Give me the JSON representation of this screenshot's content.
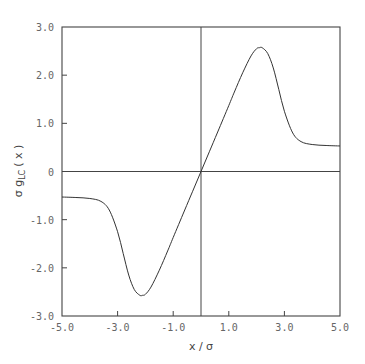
{
  "chart_data": {
    "type": "line",
    "title": "",
    "xlabel": "x / σ",
    "ylabel": "σ g_LC (x)",
    "ylabel_parts": {
      "main": "σ g",
      "sub": "LC",
      "tail": " ( x )"
    },
    "xlim": [
      -5.0,
      5.0
    ],
    "ylim": [
      -3.0,
      3.0
    ],
    "xticks": [
      -5.0,
      -3.0,
      -1.0,
      1.0,
      3.0,
      5.0
    ],
    "xtick_labels": [
      "-5.0",
      "-3.0",
      "-1.0",
      "1.0",
      "3.0",
      "5.0"
    ],
    "yticks": [
      3.0,
      2.0,
      1.0,
      0,
      -1.0,
      -2.0,
      -3.0
    ],
    "ytick_labels": [
      "3.0",
      "2.0",
      "1.0",
      "0",
      "-1.0",
      "-2.0",
      "-3.0"
    ],
    "grid": false,
    "zero_lines": true,
    "legend": null,
    "series": [
      {
        "name": "g_LC",
        "x": [
          -5.0,
          -4.5,
          -4.0,
          -3.6,
          -3.3,
          -3.0,
          -2.8,
          -2.6,
          -2.4,
          -2.2,
          -2.1,
          -2.0,
          -1.8,
          -1.5,
          -1.2,
          -1.0,
          -0.6,
          -0.3,
          0.0,
          0.3,
          0.6,
          1.0,
          1.2,
          1.5,
          1.8,
          2.0,
          2.1,
          2.2,
          2.4,
          2.6,
          2.8,
          3.0,
          3.3,
          3.6,
          4.0,
          4.5,
          5.0
        ],
        "y": [
          -0.53,
          -0.54,
          -0.56,
          -0.62,
          -0.8,
          -1.25,
          -1.7,
          -2.15,
          -2.45,
          -2.57,
          -2.57,
          -2.55,
          -2.4,
          -2.05,
          -1.65,
          -1.37,
          -0.82,
          -0.41,
          0.0,
          0.41,
          0.82,
          1.37,
          1.65,
          2.05,
          2.4,
          2.55,
          2.57,
          2.57,
          2.45,
          2.15,
          1.7,
          1.25,
          0.8,
          0.62,
          0.56,
          0.54,
          0.53
        ]
      }
    ]
  },
  "axes": {
    "xlabel": "x / σ",
    "ylabel_main": "σ g",
    "ylabel_sub": "LC",
    "ylabel_tail": "( x )"
  }
}
